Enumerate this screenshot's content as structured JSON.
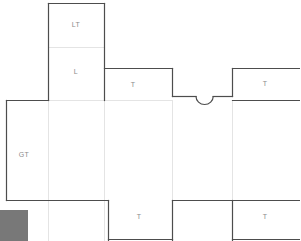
{
  "document": {
    "kind": "carton-dieline-drawing",
    "background_color": "#ffffff",
    "cut_line_color": "#4d4d4d",
    "fold_line_color": "#e2e2e2",
    "label_color": "#8c8c8c",
    "swatch_color": "#787878",
    "width": 300,
    "height": 241
  },
  "labels": {
    "lid_tuck": "LT",
    "lid": "L",
    "glue_tab": "GT",
    "tab_mid_left": "T",
    "tab_mid_right": "T",
    "tab_bottom_left": "T",
    "tab_bottom_right": "T"
  },
  "label_positions": {
    "lid_tuck": {
      "x": 76,
      "y": 24
    },
    "lid": {
      "x": 76,
      "y": 71
    },
    "glue_tab": {
      "x": 24,
      "y": 154
    },
    "tab_mid_left": {
      "x": 133,
      "y": 84
    },
    "tab_mid_right": {
      "x": 265,
      "y": 83
    },
    "tab_bottom_left": {
      "x": 139,
      "y": 216
    },
    "tab_bottom_right": {
      "x": 265,
      "y": 216
    }
  },
  "geometry": {
    "cut_outline": "M 48.5 3.5 L 104.5 3.5 L 104.5 68.5 L 172.5 68.5 L 172.5 96.5 L 196.5 96.5 A 8.5 8.5 0 0 0 213.5 96.5 L 232.5 96.5 L 232.5 68.5 L 300 68.5 L 300 100.5 L 232.5 100.5 L 232.5 200.5 L 300 200.5 L 300 241 L 232.5 241 L 232.5 200.5 L 172.5 200.5 L 172.5 241 L 108.5 241 L 108.5 200.5 L 48.5 200.5 L 48.5 241 L 48.5 200.5 L 6.5 200.5 L 6.5 100.5 L 48.5 100.5 Z",
    "cut_segments": [
      {
        "name": "lid-tuck-left",
        "d": "M 48.5 3.5 L 48.5 100.5"
      },
      {
        "name": "lid-tuck-top",
        "d": "M 48.5 3.5 L 104.5 3.5"
      },
      {
        "name": "lid-tuck-right",
        "d": "M 104.5 3.5 L 104.5 100.5"
      },
      {
        "name": "tab-mid-left-top",
        "d": "M 104.5 68.5 L 172.5 68.5"
      },
      {
        "name": "tab-mid-left-right",
        "d": "M 172.5 68.5 L 172.5 96.5"
      },
      {
        "name": "notch-left-run",
        "d": "M 172.5 96.5 L 196.5 96.5"
      },
      {
        "name": "notch-arc",
        "d": "M 196.5 96.5 A 8.5 8.5 0 0 0 213.5 96.5"
      },
      {
        "name": "notch-right-run",
        "d": "M 213.5 96.5 L 232.5 96.5"
      },
      {
        "name": "tab-mid-right-left",
        "d": "M 232.5 68.5 L 232.5 96.5"
      },
      {
        "name": "tab-mid-right-top",
        "d": "M 232.5 68.5 L 300 68.5"
      },
      {
        "name": "glue-tab-left",
        "d": "M 6.5 100.5 L 6.5 200.5"
      },
      {
        "name": "glue-tab-top",
        "d": "M 6.5 100.5 L 48.5 100.5"
      },
      {
        "name": "glue-tab-bottom",
        "d": "M 6.5 200.5 L 48.5 200.5"
      },
      {
        "name": "body-bottom-left",
        "d": "M 48.5 200.5 L 108.5 200.5"
      },
      {
        "name": "tab-bottom-left-left",
        "d": "M 108.5 200.5 L 108.5 241"
      },
      {
        "name": "tab-bottom-left-right",
        "d": "M 172.5 200.5 L 172.5 241"
      },
      {
        "name": "body-bottom-mid",
        "d": "M 172.5 200.5 L 232.5 200.5"
      },
      {
        "name": "tab-bottom-right-left",
        "d": "M 232.5 200.5 L 232.5 241"
      },
      {
        "name": "body-bottom-right",
        "d": "M 232.5 200.5 L 300 200.5"
      },
      {
        "name": "mid-right-under",
        "d": "M 232.5 100.5 L 300 100.5"
      },
      {
        "name": "mid-right-left-run",
        "d": "M 232.5 100.5 L 232.5 200.5"
      },
      {
        "name": "tab-bottom-left-base",
        "d": "M 108.5 240.5 L 172.5 240.5"
      },
      {
        "name": "tab-bottom-right-base",
        "d": "M 232.5 240.5 L 300 240.5"
      }
    ],
    "fold_lines": [
      {
        "name": "fold-lid-tuck-to-lid",
        "d": "M 48.5 47.5 L 104.5 47.5"
      },
      {
        "name": "fold-lid-bottom",
        "d": "M 48.5 100.5 L 104.5 100.5"
      },
      {
        "name": "fold-left-vertical",
        "d": "M 48.5 100.5 L 48.5 200.5"
      },
      {
        "name": "fold-right-vertical",
        "d": "M 104.5 100.5 L 104.5 200.5"
      },
      {
        "name": "fold-mid-vertical",
        "d": "M 172.5 96.5 L 172.5 200.5"
      },
      {
        "name": "fold-mid-right-vertical",
        "d": "M 232.5 100.5 L 232.5 200.5"
      },
      {
        "name": "fold-top-band",
        "d": "M 104.5 100.5 L 172.5 100.5"
      },
      {
        "name": "fold-right-band",
        "d": "M 232.5 100.5 L 300 100.5"
      },
      {
        "name": "fold-bottom-band-left",
        "d": "M 48.5 200.5 L 108.5 200.5"
      },
      {
        "name": "fold-bottom-band-mid",
        "d": "M 172.5 200.5 L 232.5 200.5"
      },
      {
        "name": "fold-bottom-band-right",
        "d": "M 232.5 200.5 L 300 200.5"
      },
      {
        "name": "fold-glue-seam",
        "d": "M 48.5 100.5 L 48.5 200.5"
      }
    ],
    "color_swatch": {
      "x": 0,
      "y": 210,
      "width": 28,
      "height": 31
    }
  }
}
